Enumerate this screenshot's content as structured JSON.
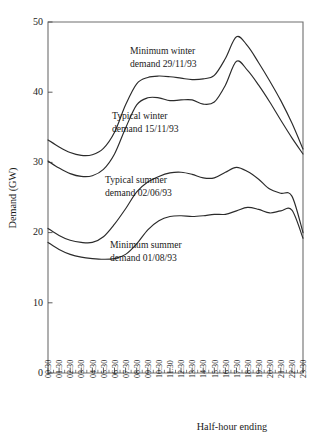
{
  "chart_data": {
    "type": "line",
    "title": "",
    "xlabel": "Half-hour ending",
    "ylabel": "Demand (GW)",
    "ylim": [
      0,
      50
    ],
    "yticks": [
      0,
      10,
      20,
      30,
      40,
      50
    ],
    "grid": false,
    "legend_position": "inline-annotations",
    "x": [
      "00.30",
      "01.30",
      "02.30",
      "03.30",
      "04.30",
      "05.30",
      "06.30",
      "07.30",
      "08.30",
      "09.30",
      "10.30",
      "11.30",
      "12.30",
      "13.30",
      "14.30",
      "15.30",
      "16.30",
      "17.30",
      "18.30",
      "19.30",
      "20.30",
      "21.30",
      "22.30",
      "23.30"
    ],
    "xtick_labels": [
      "00.30",
      "01.30",
      "02.30",
      "03.30",
      "04.30",
      "05.30",
      "06.30",
      "07.30",
      "08.30",
      "09.30",
      "10.30",
      "11.30",
      "12.30",
      "13.30",
      "14.30",
      "15.30",
      "16.30",
      "17.30",
      "18.30",
      "19.30",
      "20.30",
      "21.30",
      "22.30",
      "23.30"
    ],
    "series": [
      {
        "name": "Minimum winter demand 29/11/93",
        "values": [
          33.2,
          32.2,
          31.4,
          31.0,
          31.1,
          32.0,
          34.3,
          38.2,
          41.2,
          42.1,
          42.3,
          42.2,
          42.0,
          41.8,
          41.9,
          42.4,
          44.8,
          47.9,
          46.6,
          44.2,
          41.6,
          38.8,
          35.6,
          31.9
        ]
      },
      {
        "name": "Typical winter demand 15/11/93",
        "values": [
          30.2,
          29.2,
          28.4,
          28.0,
          28.1,
          29.0,
          31.2,
          34.9,
          38.2,
          39.2,
          39.2,
          38.8,
          38.9,
          38.9,
          38.3,
          38.6,
          41.0,
          44.4,
          43.1,
          41.0,
          38.6,
          36.0,
          33.5,
          31.2
        ]
      },
      {
        "name": "Typical summer demand 02/06/93",
        "values": [
          20.6,
          19.6,
          18.9,
          18.6,
          18.6,
          19.4,
          21.2,
          23.4,
          25.8,
          27.2,
          28.0,
          28.5,
          28.6,
          28.3,
          27.8,
          27.8,
          28.6,
          29.3,
          28.7,
          27.6,
          26.2,
          25.6,
          25.2,
          20.0
        ]
      },
      {
        "name": "Minimum summer demand 01/08/93",
        "values": [
          18.6,
          17.6,
          16.9,
          16.5,
          16.3,
          16.2,
          16.3,
          16.9,
          18.4,
          20.4,
          21.7,
          22.3,
          22.4,
          22.3,
          22.4,
          22.6,
          22.6,
          23.1,
          23.6,
          23.3,
          22.8,
          23.1,
          23.2,
          19.2
        ]
      }
    ],
    "annotations": [
      {
        "id": "annot-minimum-winter",
        "line1": "Minimum winter",
        "line2": "demand 29/11/93",
        "x_px": 130,
        "y_px": 54
      },
      {
        "id": "annot-typical-winter",
        "line1": "Typical winter",
        "line2": "demand 15/11/93",
        "x_px": 112,
        "y_px": 119
      },
      {
        "id": "annot-typical-summer",
        "line1": "Typical summer",
        "line2": "demand 02/06/93",
        "x_px": 105,
        "y_px": 183
      },
      {
        "id": "annot-minimum-summer",
        "line1": "Minimum summer",
        "line2": "demand 01/08/93",
        "x_px": 110,
        "y_px": 248
      }
    ],
    "colors": {
      "line": "#2b2b2b",
      "axis": "#6e6e6e",
      "text": "#1a1a1a",
      "background": "#ffffff"
    }
  }
}
